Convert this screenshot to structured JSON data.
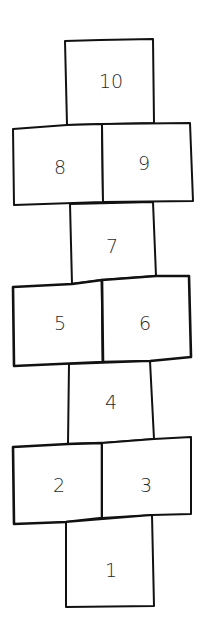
{
  "diagram": {
    "type": "hopscotch-court",
    "stroke_color": "#111111",
    "background": "#ffffff",
    "squares": [
      {
        "label": "1",
        "row": 1,
        "position": "single"
      },
      {
        "label": "2",
        "row": 2,
        "position": "left"
      },
      {
        "label": "3",
        "row": 2,
        "position": "right"
      },
      {
        "label": "4",
        "row": 3,
        "position": "single"
      },
      {
        "label": "5",
        "row": 4,
        "position": "left"
      },
      {
        "label": "6",
        "row": 4,
        "position": "right"
      },
      {
        "label": "7",
        "row": 5,
        "position": "single"
      },
      {
        "label": "8",
        "row": 6,
        "position": "left"
      },
      {
        "label": "9",
        "row": 6,
        "position": "right"
      },
      {
        "label": "10",
        "row": 7,
        "position": "single"
      }
    ]
  }
}
